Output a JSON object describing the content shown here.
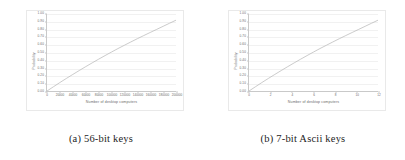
{
  "figure": {
    "subfigures": [
      {
        "caption": "(a) 56-bit keys",
        "chart_data": {
          "type": "line",
          "title": "",
          "xlabel": "Number of desktop computers",
          "ylabel": "Probability",
          "xlim": [
            0,
            200000
          ],
          "ylim": [
            0.0,
            1.0
          ],
          "grid": true,
          "legend": "none",
          "xticks": [
            0,
            20000,
            40000,
            60000,
            80000,
            100000,
            120000,
            140000,
            160000,
            180000,
            200000
          ],
          "xticklabels": [
            "0",
            "20000",
            "40000",
            "60000",
            "80000",
            "100000",
            "120000",
            "140000",
            "160000",
            "180000",
            "200000"
          ],
          "yticks": [
            0.0,
            0.1,
            0.2,
            0.3,
            0.4,
            0.5,
            0.6,
            0.7,
            0.8,
            0.9,
            1.0
          ],
          "yticklabels": [
            "0.00",
            "0.10",
            "0.20",
            "0.30",
            "0.40",
            "0.50",
            "0.60",
            "0.70",
            "0.80",
            "0.90",
            "1.00"
          ],
          "x": [
            0,
            10000,
            20000,
            30000,
            40000,
            50000,
            60000,
            70000,
            80000,
            90000,
            100000,
            110000,
            120000,
            130000,
            140000,
            150000,
            160000,
            170000,
            180000,
            190000,
            200000
          ],
          "y": [
            0.0,
            0.055,
            0.11,
            0.163,
            0.215,
            0.266,
            0.316,
            0.365,
            0.413,
            0.46,
            0.506,
            0.551,
            0.594,
            0.637,
            0.679,
            0.72,
            0.76,
            0.8,
            0.84,
            0.88,
            0.92
          ],
          "series": [
            {
              "name": "probability",
              "values": [
                0.0,
                0.055,
                0.11,
                0.163,
                0.215,
                0.266,
                0.316,
                0.365,
                0.413,
                0.46,
                0.506,
                0.551,
                0.594,
                0.637,
                0.679,
                0.72,
                0.76,
                0.8,
                0.84,
                0.88,
                0.92
              ],
              "color": "#b4b4b4"
            }
          ]
        }
      },
      {
        "caption": "(b) 7-bit Ascii keys",
        "chart_data": {
          "type": "line",
          "title": "",
          "xlabel": "Number of desktop computers",
          "ylabel": "Probability",
          "xlim": [
            0,
            12
          ],
          "ylim": [
            0.0,
            1.0
          ],
          "grid": true,
          "legend": "none",
          "xticks": [
            0,
            2,
            4,
            6,
            8,
            10,
            12
          ],
          "xticklabels": [
            "0",
            "2",
            "4",
            "6",
            "8",
            "10",
            "12"
          ],
          "yticks": [
            0.0,
            0.1,
            0.2,
            0.3,
            0.4,
            0.5,
            0.6,
            0.7,
            0.8,
            0.9,
            1.0
          ],
          "yticklabels": [
            "0.00",
            "0.10",
            "0.20",
            "0.30",
            "0.40",
            "0.50",
            "0.60",
            "0.70",
            "0.80",
            "0.90",
            "1.00"
          ],
          "x": [
            0,
            0.6,
            1.2,
            1.8,
            2.4,
            3.0,
            3.6,
            4.2,
            4.8,
            5.4,
            6.0,
            6.6,
            7.2,
            7.8,
            8.4,
            9.0,
            9.6,
            10.2,
            10.8,
            11.4,
            12.0
          ],
          "y": [
            0.0,
            0.055,
            0.11,
            0.163,
            0.215,
            0.266,
            0.316,
            0.365,
            0.413,
            0.46,
            0.506,
            0.551,
            0.594,
            0.637,
            0.679,
            0.72,
            0.76,
            0.8,
            0.84,
            0.88,
            0.92
          ],
          "series": [
            {
              "name": "probability",
              "values": [
                0.0,
                0.055,
                0.11,
                0.163,
                0.215,
                0.266,
                0.316,
                0.365,
                0.413,
                0.46,
                0.506,
                0.551,
                0.594,
                0.637,
                0.679,
                0.72,
                0.76,
                0.8,
                0.84,
                0.88,
                0.92
              ],
              "color": "#b4b4b4"
            }
          ]
        }
      }
    ]
  }
}
